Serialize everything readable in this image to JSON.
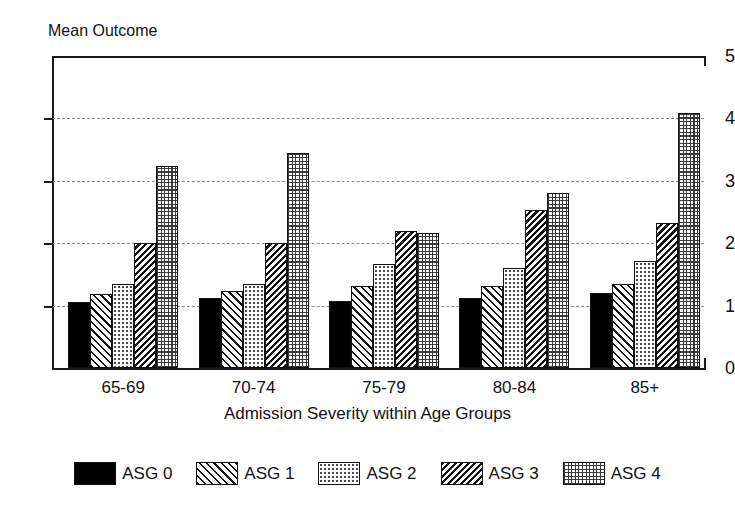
{
  "chart_data": {
    "type": "bar",
    "title": "",
    "ylabel": "Mean Outcome",
    "xlabel": "Admission Severity within Age Groups",
    "ylim": [
      0,
      5
    ],
    "yticks": [
      "0",
      "1",
      "2",
      "3",
      "4",
      "5"
    ],
    "grid": "horizontal dashed at 1,2,3,4",
    "legend_position": "bottom-center",
    "categories": [
      "65-69",
      "70-74",
      "75-79",
      "80-84",
      "85+"
    ],
    "series": [
      {
        "name": "ASG 0",
        "pattern": "solid-black",
        "values": [
          1.05,
          1.12,
          1.08,
          1.13,
          1.2
        ]
      },
      {
        "name": "ASG 1",
        "pattern": "diagonal-hatch",
        "values": [
          1.18,
          1.24,
          1.31,
          1.31,
          1.35
        ]
      },
      {
        "name": "ASG 2",
        "pattern": "light-dots",
        "values": [
          1.35,
          1.34,
          1.66,
          1.61,
          1.72
        ]
      },
      {
        "name": "ASG 3",
        "pattern": "dense-diagonal-hatch",
        "values": [
          2.01,
          2.01,
          2.19,
          2.53,
          2.32
        ]
      },
      {
        "name": "ASG 4",
        "pattern": "cross-grid",
        "values": [
          3.24,
          3.44,
          2.17,
          2.8,
          4.08
        ]
      }
    ]
  },
  "axes": {
    "y_title": "Mean Outcome",
    "x_title": "Admission Severity within Age Groups",
    "y_ticks": [
      {
        "label": "5",
        "value": 5
      },
      {
        "label": "4",
        "value": 4
      },
      {
        "label": "3",
        "value": 3
      },
      {
        "label": "2",
        "value": 2
      },
      {
        "label": "1",
        "value": 1
      },
      {
        "label": "0",
        "value": 0
      }
    ],
    "x_categories": [
      {
        "label": "65-69"
      },
      {
        "label": "70-74"
      },
      {
        "label": "75-79"
      },
      {
        "label": "80-84"
      },
      {
        "label": "85+"
      }
    ]
  },
  "legend": {
    "items": [
      {
        "label": "ASG 0",
        "pattern": "solid-black"
      },
      {
        "label": "ASG 1",
        "pattern": "diagonal-hatch"
      },
      {
        "label": "ASG 2",
        "pattern": "light-dots"
      },
      {
        "label": "ASG 3",
        "pattern": "dense-diagonal-hatch"
      },
      {
        "label": "ASG 4",
        "pattern": "cross-grid"
      }
    ]
  },
  "colors": {
    "axis": "#1a1a1a",
    "grid": "#8a8a8a",
    "bar_outline": "#111111",
    "solid_fill": "#000000",
    "background": "#ffffff"
  }
}
